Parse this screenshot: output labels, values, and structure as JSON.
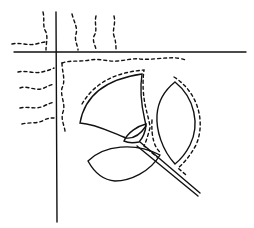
{
  "diagram": {
    "type": "quilting-applique-pattern",
    "colors": {
      "line": "#111111",
      "background": "#ffffff"
    },
    "elements": [
      {
        "id": "horizontal-rule",
        "style": "solid"
      },
      {
        "id": "vertical-rule",
        "style": "solid"
      },
      {
        "id": "flower-bud",
        "style": "solid"
      },
      {
        "id": "bud-calyx",
        "style": "solid"
      },
      {
        "id": "upper-right-leaf",
        "style": "solid"
      },
      {
        "id": "lower-leaf",
        "style": "solid"
      },
      {
        "id": "stem",
        "style": "double-solid"
      },
      {
        "id": "echo-stitch-lines",
        "style": "dashed"
      },
      {
        "id": "wavy-quilting-lines",
        "style": "dashed"
      }
    ]
  }
}
